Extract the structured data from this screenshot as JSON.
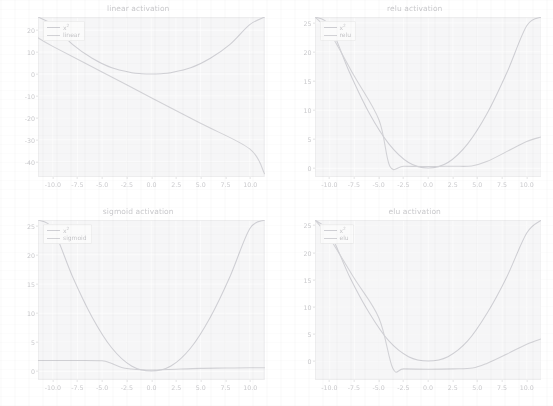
{
  "figure": {
    "background_color": "#ffffff",
    "axes_face_color": "#f6f6f7",
    "grid_color": "#fdfdfd",
    "tick_label_color": "#cacacd",
    "title_color": "#c9c9cc",
    "series_colors": {
      "x2": "#cfcfd4",
      "activation": "#d2d2d6"
    }
  },
  "chart_data": [
    {
      "type": "line",
      "title": "linear activation",
      "xlabel": "",
      "ylabel": "",
      "xlim": [
        -11.5,
        11.5
      ],
      "ylim": [
        -47,
        26
      ],
      "xticks": [
        "-10.0",
        "-7.5",
        "-5.0",
        "-2.5",
        "0.0",
        "2.5",
        "5.0",
        "7.5",
        "10.0"
      ],
      "xtick_values": [
        -10.0,
        -7.5,
        -5.0,
        -2.5,
        0.0,
        2.5,
        5.0,
        7.5,
        10.0
      ],
      "yticks": [
        "20",
        "10",
        "0",
        "-10",
        "-20",
        "-30",
        "-40"
      ],
      "ytick_values": [
        20,
        10,
        0,
        -10,
        -20,
        -30,
        -40
      ],
      "grid": true,
      "legend_position": "upper left",
      "series": [
        {
          "name": "x²",
          "legend_label": "x2",
          "color": "#cfcfd4",
          "x": [
            -11.5,
            -10,
            -8,
            -6,
            -4,
            -2,
            -1,
            0,
            1,
            2,
            4,
            6,
            8,
            10,
            11.5
          ],
          "values": [
            26,
            22.5,
            13.5,
            7.2,
            2.8,
            0.6,
            0.15,
            0.0,
            0.15,
            0.6,
            2.8,
            7.2,
            13.5,
            22.5,
            26
          ]
        },
        {
          "name": "linear",
          "legend_label": "linear",
          "color": "#d2d2d6",
          "x": [
            -11.5,
            -10,
            -5,
            0,
            5,
            10,
            11.5
          ],
          "values": [
            16.5,
            12.6,
            0.9,
            -10.8,
            -22.5,
            -34.2,
            -45.5
          ]
        }
      ]
    },
    {
      "type": "line",
      "title": "relu activation",
      "xlabel": "",
      "ylabel": "",
      "xlim": [
        -11.5,
        11.5
      ],
      "ylim": [
        -1.5,
        26
      ],
      "xticks": [
        "-10.0",
        "-7.5",
        "-5.0",
        "-2.5",
        "0.0",
        "2.5",
        "5.0",
        "7.5",
        "10.0"
      ],
      "xtick_values": [
        -10.0,
        -7.5,
        -5.0,
        -2.5,
        0.0,
        2.5,
        5.0,
        7.5,
        10.0
      ],
      "yticks": [
        "25",
        "20",
        "15",
        "10",
        "5",
        "0"
      ],
      "ytick_values": [
        25,
        20,
        15,
        10,
        5,
        0
      ],
      "grid": true,
      "legend_position": "upper left",
      "series": [
        {
          "name": "x²",
          "legend_label": "x2",
          "color": "#cfcfd4",
          "x": [
            -11.5,
            -10,
            -8,
            -6,
            -4,
            -2,
            0,
            2,
            4,
            6,
            8,
            10,
            11.5
          ],
          "values": [
            26,
            24.5,
            16.5,
            9.5,
            4.2,
            1.0,
            0.05,
            1.0,
            4.2,
            9.5,
            16.5,
            24.5,
            26
          ]
        },
        {
          "name": "relu",
          "legend_label": "relu",
          "color": "#d2d2d6",
          "x": [
            -11.5,
            -10,
            -7.5,
            -5,
            -3.9,
            -2.5,
            0,
            2.5,
            4.4,
            6,
            8,
            10,
            11.5
          ],
          "values": [
            26,
            23.3,
            15.8,
            8.3,
            0.35,
            0.35,
            0.3,
            0.35,
            0.4,
            1.2,
            2.9,
            4.6,
            5.4
          ]
        }
      ]
    },
    {
      "type": "line",
      "title": "sigmoid activation",
      "xlabel": "",
      "ylabel": "",
      "xlim": [
        -11.5,
        11.5
      ],
      "ylim": [
        -1.5,
        26
      ],
      "xticks": [
        "-10.0",
        "-7.5",
        "-5.0",
        "-2.5",
        "0.0",
        "2.5",
        "5.0",
        "7.5",
        "10.0"
      ],
      "xtick_values": [
        -10.0,
        -7.5,
        -5.0,
        -2.5,
        0.0,
        2.5,
        5.0,
        7.5,
        10.0
      ],
      "yticks": [
        "25",
        "20",
        "15",
        "10",
        "5",
        "0"
      ],
      "ytick_values": [
        25,
        20,
        15,
        10,
        5,
        0
      ],
      "grid": true,
      "legend_position": "upper left",
      "series": [
        {
          "name": "x²",
          "legend_label": "x2",
          "color": "#cfcfd4",
          "x": [
            -11.5,
            -10,
            -8,
            -6,
            -4,
            -2,
            0,
            2,
            4,
            6,
            8,
            10,
            11.5
          ],
          "values": [
            26,
            24.5,
            16.3,
            9.3,
            4.0,
            0.9,
            0.05,
            0.9,
            4.0,
            9.3,
            16.3,
            24.5,
            26
          ]
        },
        {
          "name": "sigmoid",
          "legend_label": "sigmoid",
          "color": "#d2d2d6",
          "x": [
            -11.5,
            -10,
            -7.5,
            -5,
            -4.2,
            -3,
            -2,
            -1,
            0,
            1,
            2.5,
            5,
            7.5,
            10,
            11.5
          ],
          "values": [
            1.85,
            1.85,
            1.85,
            1.8,
            1.45,
            0.65,
            0.4,
            0.25,
            0.2,
            0.25,
            0.35,
            0.5,
            0.55,
            0.6,
            0.6
          ]
        }
      ]
    },
    {
      "type": "line",
      "title": "elu activation",
      "xlabel": "",
      "ylabel": "",
      "xlim": [
        -11.5,
        11.5
      ],
      "ylim": [
        -3.5,
        26
      ],
      "xticks": [
        "-10.0",
        "-7.5",
        "-5.0",
        "-2.5",
        "0.0",
        "2.5",
        "5.0",
        "7.5",
        "10.0"
      ],
      "xtick_values": [
        -10.0,
        -7.5,
        -5.0,
        -2.5,
        0.0,
        2.5,
        5.0,
        7.5,
        10.0
      ],
      "yticks": [
        "25",
        "20",
        "15",
        "10",
        "5",
        "0"
      ],
      "ytick_values": [
        25,
        20,
        15,
        10,
        5,
        0
      ],
      "grid": true,
      "legend_position": "upper left",
      "series": [
        {
          "name": "x²",
          "legend_label": "x2",
          "color": "#cfcfd4",
          "x": [
            -11.5,
            -10,
            -8,
            -6,
            -4,
            -2,
            0,
            2,
            4,
            6,
            8,
            10,
            11.5
          ],
          "values": [
            26,
            23.6,
            15.6,
            8.9,
            3.7,
            0.8,
            0.0,
            0.8,
            3.7,
            8.9,
            15.6,
            23.6,
            26
          ]
        },
        {
          "name": "elu",
          "legend_label": "elu",
          "color": "#d2d2d6",
          "x": [
            -11.5,
            -10,
            -7.5,
            -5,
            -3.6,
            -2.5,
            0,
            2.5,
            4.5,
            6,
            8,
            10,
            11.5
          ],
          "values": [
            26,
            22.6,
            15.2,
            7.9,
            -1.35,
            -1.45,
            -1.5,
            -1.45,
            -1.3,
            -0.4,
            1.3,
            3.1,
            4.1
          ]
        }
      ]
    }
  ]
}
